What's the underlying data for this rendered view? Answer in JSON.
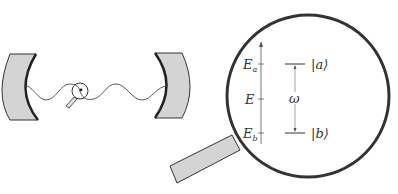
{
  "diagram": {
    "energy_axis": {
      "labels": [
        {
          "main": "E",
          "sub": "a"
        },
        {
          "main": "E",
          "sub": ""
        },
        {
          "main": "E",
          "sub": "b"
        }
      ]
    },
    "levels": {
      "upper": "|a⟩",
      "lower": "|b⟩",
      "transition": "ω"
    },
    "colors": {
      "mirror_fill": "#d4d4d4",
      "stroke": "#333333",
      "line": "#555555"
    }
  }
}
